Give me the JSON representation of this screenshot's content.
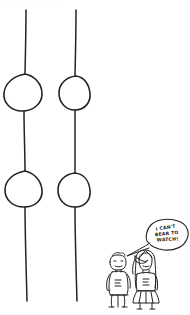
{
  "image": {
    "title": "Two knotted vertical lines with cartoon couple",
    "width": 190,
    "height": 315,
    "background_color": "#ffffff",
    "ink_color": "#222222",
    "style": "hand-drawn pen cartoon"
  },
  "header": {
    "faint_text": ". .  .   .  .   . .  .  .  .  ."
  },
  "strands": [
    {
      "name": "left-strand",
      "x": 26,
      "top": 10,
      "bottom": 301,
      "knots": [
        {
          "name": "left-upper-knot",
          "cx": 22,
          "cy": 92,
          "rx": 19,
          "ry": 19
        },
        {
          "name": "left-lower-knot",
          "cx": 22,
          "cy": 189,
          "rx": 19,
          "ry": 17
        }
      ]
    },
    {
      "name": "right-strand",
      "x": 76,
      "top": 10,
      "bottom": 301,
      "knots": [
        {
          "name": "right-upper-knot",
          "cx": 74,
          "cy": 92,
          "rx": 15,
          "ry": 16
        },
        {
          "name": "right-lower-knot",
          "cx": 74,
          "cy": 189,
          "rx": 15,
          "ry": 16
        }
      ]
    }
  ],
  "speech_bubble": {
    "name": "speech-bubble",
    "lines": [
      "I CAN'T",
      "BEAR TO",
      "WATCH!"
    ],
    "full_text": "I CAN'T BEAR TO WATCH!",
    "cx": 166,
    "cy": 235,
    "rx": 22,
    "ry": 14,
    "tail_to": [
      126,
      258
    ]
  },
  "figures": [
    {
      "name": "man-figure",
      "label": "man standing",
      "x": 108,
      "y": 256,
      "width": 24,
      "height": 52
    },
    {
      "name": "woman-figure",
      "label": "woman covering eyes",
      "x": 132,
      "y": 252,
      "width": 26,
      "height": 56
    }
  ]
}
